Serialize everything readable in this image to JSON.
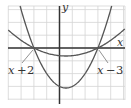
{
  "chart_data": {
    "type": "line",
    "title": "",
    "xlabel": "x",
    "ylabel": "y",
    "xlim": [
      -4,
      5
    ],
    "ylim": [
      -8,
      7
    ],
    "grid": true,
    "grid_step": {
      "x": 1,
      "y": 2
    },
    "series": [
      {
        "name": "y = (x + 2)(x - 3)",
        "kind": "narrow-parabola",
        "roots": [
          -2,
          3
        ],
        "vertex": [
          0.5,
          -6.25
        ],
        "scale": 1
      },
      {
        "name": "y = (x + 2)(x - 3)/5",
        "kind": "wide-parabola",
        "roots": [
          -2,
          3
        ],
        "vertex": [
          0.5,
          -1.25
        ],
        "scale": 0.2
      }
    ],
    "annotations": [
      {
        "text": "x + 2",
        "points_to": [
          -2,
          0
        ]
      },
      {
        "text": "x − 3",
        "points_to": [
          3,
          0
        ]
      }
    ]
  },
  "labels": {
    "x_axis": "x",
    "y_axis": "y",
    "left_factor": {
      "var": "x",
      "op": "+",
      "num": "2"
    },
    "right_factor": {
      "var": "x",
      "op": "−",
      "num": "3"
    }
  },
  "colors": {
    "grid": "#d4d4d4",
    "axis": "#333333",
    "curve": "#555555",
    "leader": "#777777"
  }
}
